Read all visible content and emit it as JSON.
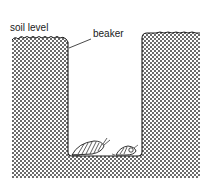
{
  "figure": {
    "type": "pitfall-trap-diagram",
    "labels": {
      "soil_level": "soil level",
      "beaker": "beaker"
    },
    "elements": [
      {
        "name": "soil",
        "pattern": "stippled"
      },
      {
        "name": "beaker",
        "shape": "rounded-bottom open container sunk in soil"
      },
      {
        "name": "insect-beetle",
        "position": "floor of beaker, left"
      },
      {
        "name": "insect-small",
        "position": "floor of beaker, right"
      }
    ],
    "colors": {
      "ink": "#1a1a1a",
      "background": "#ffffff",
      "dot": "#2a2a2a"
    }
  }
}
